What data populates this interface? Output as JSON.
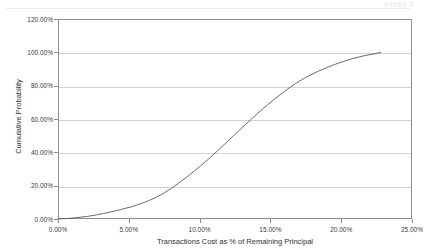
{
  "header": {
    "clipped_text": "Exhibit 3"
  },
  "chart_data": {
    "type": "line",
    "title": "",
    "subtitle": "",
    "xlabel": "Transactions Cost as % of Remaining Principal",
    "ylabel": "Cumulative Probability",
    "xlim": [
      0,
      25
    ],
    "ylim": [
      0,
      120
    ],
    "grid": "horizontal",
    "legend": "none",
    "x_tick_labels": [
      "0.00%",
      "5.00%",
      "10.00%",
      "15.00%",
      "20.00%",
      "25.00%"
    ],
    "x_tick_values": [
      0,
      5,
      10,
      15,
      20,
      25
    ],
    "y_tick_labels": [
      "0.00%",
      "20.00%",
      "40.00%",
      "60.00%",
      "80.00%",
      "100.00%",
      "120.00%"
    ],
    "y_tick_values": [
      0,
      20,
      40,
      60,
      80,
      100,
      120
    ],
    "series": [
      {
        "name": "Cumulative Probability",
        "color": "#585858",
        "x": [
          0.0,
          0.4,
          0.8,
          1.2,
          1.6,
          2.0,
          2.4,
          2.8,
          3.2,
          3.6,
          4.0,
          4.4,
          4.8,
          5.2,
          5.6,
          6.0,
          6.4,
          6.8,
          7.2,
          7.6,
          8.0,
          8.4,
          8.8,
          9.2,
          9.6,
          10.0,
          10.4,
          10.8,
          11.2,
          11.6,
          12.0,
          12.4,
          12.8,
          13.2,
          13.6,
          14.0,
          14.4,
          14.8,
          15.2,
          15.6,
          16.0,
          16.4,
          16.8,
          17.2,
          17.6,
          18.0,
          18.4,
          18.8,
          19.2,
          19.6,
          20.0,
          20.4,
          20.8,
          21.2,
          21.6,
          22.0,
          22.4,
          22.8
        ],
        "y": [
          0.0,
          0.2,
          0.4,
          0.7,
          1.1,
          1.5,
          2.0,
          2.6,
          3.3,
          4.0,
          4.8,
          5.6,
          6.5,
          7.4,
          8.5,
          9.7,
          11.0,
          12.5,
          14.2,
          16.2,
          18.4,
          20.8,
          23.3,
          25.9,
          28.6,
          31.4,
          34.3,
          37.3,
          40.4,
          43.6,
          46.8,
          50.0,
          53.2,
          56.4,
          59.5,
          62.6,
          65.6,
          68.5,
          71.3,
          74.0,
          76.6,
          79.1,
          81.4,
          83.5,
          85.4,
          87.1,
          88.7,
          90.2,
          91.6,
          92.9,
          94.1,
          95.2,
          96.2,
          97.1,
          97.9,
          98.6,
          99.2,
          100.0
        ]
      }
    ]
  }
}
